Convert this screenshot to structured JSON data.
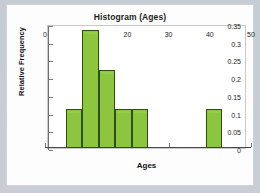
{
  "chart_data": {
    "type": "bar",
    "title": "Histogram (Ages)",
    "xlabel": "Ages",
    "ylabel": "Relative Frequency",
    "xlim": [
      0,
      50
    ],
    "ylim": [
      0,
      0.35
    ],
    "grid": false,
    "legend": null,
    "xticks": [
      "0",
      "10",
      "20",
      "30",
      "40",
      "50"
    ],
    "xtick_values": [
      0,
      10,
      20,
      30,
      40,
      50
    ],
    "yticks": [
      "0",
      "0.05",
      "0.1",
      "0.15",
      "0.2",
      "0.25",
      "0.3",
      "0.35"
    ],
    "ytick_values": [
      0,
      0.05,
      0.1,
      0.15,
      0.2,
      0.25,
      0.3,
      0.35
    ],
    "bar_color": "#8cc63e",
    "bar_edge_color": "#2f4f10",
    "bins": [
      {
        "start": 5,
        "end": 9,
        "label": "5-9",
        "value": 0.11
      },
      {
        "start": 9,
        "end": 13,
        "label": "9-13",
        "value": 0.333
      },
      {
        "start": 13,
        "end": 17,
        "label": "13-17",
        "value": 0.22
      },
      {
        "start": 17,
        "end": 21,
        "label": "17-21",
        "value": 0.11
      },
      {
        "start": 21,
        "end": 25,
        "label": "21-25",
        "value": 0.11
      },
      {
        "start": 39,
        "end": 43,
        "label": "39-43",
        "value": 0.11
      }
    ],
    "categories": [
      "5-9",
      "9-13",
      "13-17",
      "17-21",
      "21-25",
      "39-43"
    ],
    "values": [
      0.11,
      0.333,
      0.22,
      0.11,
      0.11,
      0.11
    ]
  },
  "figure": {
    "background_color": "#c6ccd4",
    "card_color": "#fdfdfd"
  }
}
